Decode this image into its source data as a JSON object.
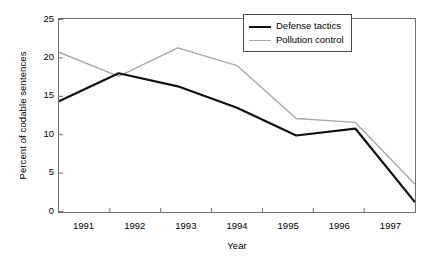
{
  "chart_data": {
    "type": "line",
    "title": "",
    "xlabel": "Year",
    "ylabel": "Percent of codable sentences",
    "categories": [
      "1991",
      "1992",
      "1993",
      "1994",
      "1995",
      "1996",
      "1997"
    ],
    "x": [
      1991,
      1992,
      1993,
      1994,
      1995,
      1996,
      1997
    ],
    "xlim": [
      1991,
      1997
    ],
    "ylim": [
      0,
      25
    ],
    "yticks": [
      0,
      5,
      10,
      15,
      20,
      25
    ],
    "ytick_labels": [
      "0",
      "5",
      "10",
      "15",
      "20",
      "25"
    ],
    "grid": false,
    "legend_position": "top-right",
    "series": [
      {
        "name": "Defense tactics",
        "color": "#111111",
        "width": 2.2,
        "values": [
          14.4,
          18.0,
          16.3,
          13.5,
          9.9,
          10.8,
          1.3
        ]
      },
      {
        "name": "Pollution control",
        "color": "#a8a8a8",
        "width": 1.4,
        "values": [
          20.7,
          17.6,
          21.3,
          19.0,
          12.1,
          11.6,
          3.6
        ]
      }
    ]
  },
  "legend": {
    "items": [
      {
        "label": "Defense tactics"
      },
      {
        "label": "Pollution control"
      }
    ]
  },
  "axes": {
    "frame_color": "#6e6e6e"
  }
}
